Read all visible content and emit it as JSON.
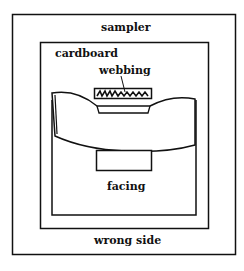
{
  "diagram": {
    "labels": {
      "outer": "sampler",
      "middle": "cardboard",
      "pointer": "webbing",
      "inner": "facing",
      "bottom": "wrong side"
    },
    "colors": {
      "line": "#111111",
      "background": "#ffffff"
    }
  }
}
